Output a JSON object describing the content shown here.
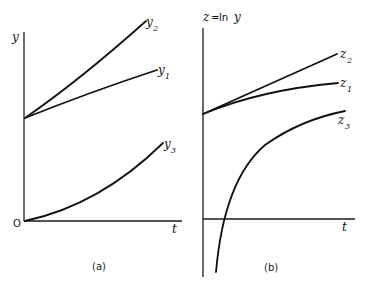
{
  "panel_a": {
    "caption": "(a)",
    "y_axis_label": "y",
    "x_axis_label": "t",
    "origin_label": "O",
    "curves": [
      {
        "name": "y",
        "sub": "2",
        "description": "exponential-like growth, convex, steepest"
      },
      {
        "name": "y",
        "sub": "1",
        "description": "near-linear growth from same intercept"
      },
      {
        "name": "y",
        "sub": "3",
        "description": "convex growth starting from origin"
      }
    ]
  },
  "panel_b": {
    "caption": "(b)",
    "y_axis_label_prefix": "z",
    "y_axis_label_eq": "=",
    "y_axis_label_fn": "ln",
    "y_axis_label_var": "y",
    "x_axis_label": "t",
    "curves": [
      {
        "name": "z",
        "sub": "2",
        "description": "straight line (log of exponential)"
      },
      {
        "name": "z",
        "sub": "1",
        "description": "concave, flattening"
      },
      {
        "name": "z",
        "sub": "3",
        "description": "log curve from -infinity, crosses t-axis"
      }
    ]
  },
  "colors": {
    "ink": "#111111",
    "background": "#ffffff"
  }
}
